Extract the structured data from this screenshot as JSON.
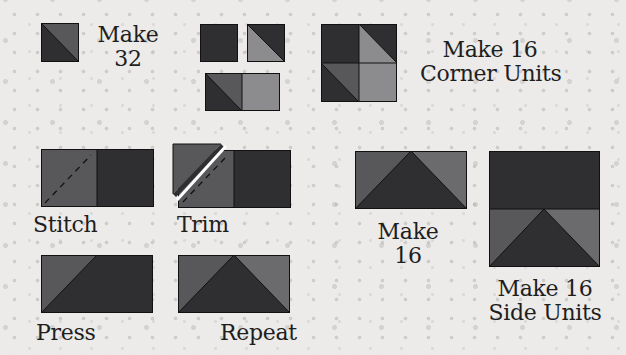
{
  "colors": {
    "dark": "#2f2f31",
    "medium": "#58585a",
    "light": "#8c8c8e",
    "outline": "#111111",
    "background": "#ecebe9",
    "stitch_line": "#111111",
    "trim_cut": "#ffffff"
  },
  "steps": {
    "hst": {
      "label_line1": "Make",
      "label_line2": "32"
    },
    "corner_units": {
      "label_line1": "Make 16",
      "label_line2": "Corner Units"
    },
    "stitch": {
      "label": "Stitch"
    },
    "trim": {
      "label": "Trim"
    },
    "press": {
      "label": "Press"
    },
    "repeat": {
      "label": "Repeat"
    },
    "flying_geese": {
      "label_line1": "Make",
      "label_line2": "16"
    },
    "side_units": {
      "label_line1": "Make 16",
      "label_line2": "Side Units"
    }
  }
}
